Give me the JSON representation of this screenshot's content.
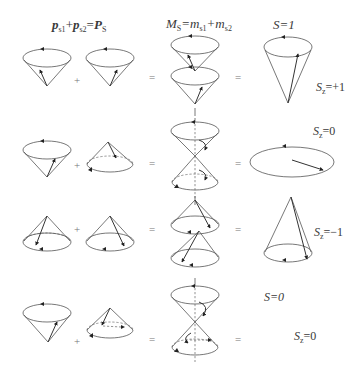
{
  "headers": {
    "vector_sum": {
      "p": "p",
      "s1": "s1",
      "plus": "+",
      "s2": "s2",
      "eq": "=",
      "P": "P",
      "S": "S"
    },
    "mag_sum": {
      "M": "M",
      "S": "S",
      "eq": "=m",
      "s1": "s1",
      "plus": "+m",
      "s2": "s2"
    },
    "total_spin_1": "S=1"
  },
  "operators": {
    "plus": "+",
    "equals": "="
  },
  "rows": [
    {
      "name": "triplet-up",
      "sz_label": {
        "S": "S",
        "z": "z",
        "val": "=+1"
      }
    },
    {
      "name": "triplet-zero",
      "sz_label": {
        "S": "S",
        "z": "z",
        "val": "=0"
      }
    },
    {
      "name": "triplet-down",
      "sz_label": {
        "S": "S",
        "z": "z",
        "val": "=−1"
      }
    },
    {
      "name": "singlet",
      "s_label": "S=0",
      "sz_label": {
        "S": "S",
        "z": "z",
        "val": "=0"
      }
    }
  ],
  "colors": {
    "line": "#555555",
    "text": "#3a3a3a",
    "background": "#ffffff"
  }
}
